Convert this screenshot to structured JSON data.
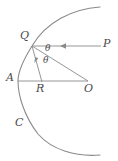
{
  "figure": {
    "type": "geometry-diagram",
    "background_color": "#ffffff",
    "stroke_color": "#8a8a8a",
    "label_color": "#4a4a4a",
    "labels": [
      {
        "id": "Q",
        "text": "Q",
        "x": 20,
        "y": 30,
        "size": "normal"
      },
      {
        "id": "P",
        "text": "P",
        "x": 103,
        "y": 38,
        "size": "normal"
      },
      {
        "id": "theta-upper",
        "text": "θ",
        "x": 45,
        "y": 44,
        "size": "small"
      },
      {
        "id": "theta-lower",
        "text": "θ",
        "x": 43,
        "y": 56,
        "size": "small"
      },
      {
        "id": "A",
        "text": "A",
        "x": 6,
        "y": 72,
        "size": "normal"
      },
      {
        "id": "R",
        "text": "R",
        "x": 36,
        "y": 83,
        "size": "normal"
      },
      {
        "id": "O",
        "text": "O",
        "x": 84,
        "y": 83,
        "size": "normal"
      },
      {
        "id": "C",
        "text": "C",
        "x": 15,
        "y": 117,
        "size": "normal"
      }
    ],
    "points": {
      "Q": {
        "x": 32,
        "y": 46
      },
      "P": {
        "x": 110,
        "y": 46
      },
      "A": {
        "x": 18,
        "y": 81
      },
      "R": {
        "x": 42,
        "y": 82
      },
      "O": {
        "x": 88,
        "y": 81
      }
    },
    "curve_label": "C",
    "curve_path": "M 100,7 C 72,9 46,22 32,46 C 22,62 18,72 18,81 C 18,95 24,116 38,134 C 52,150 76,157 100,155",
    "segments": [
      {
        "id": "incoming-ray-PQ",
        "from": "P",
        "to": "Q",
        "arrow": true
      },
      {
        "id": "reflected-ray-QR",
        "from": "Q",
        "to": "R",
        "arrow": true
      },
      {
        "id": "radius-QO",
        "from": "Q",
        "to": "O",
        "arrow": false
      },
      {
        "id": "axis-AO",
        "from": "A",
        "to": "O",
        "arrow": false
      }
    ]
  }
}
